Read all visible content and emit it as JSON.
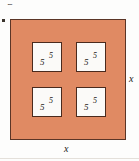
{
  "figure": {
    "clipped_caption": "igure.",
    "margin_bullet": "•",
    "outer_square": {
      "fill_color": "#e08a63",
      "border_color": "#5b3526",
      "width_label": "x",
      "height_label": "x"
    },
    "inner_squares": [
      {
        "position": "top-left",
        "base_label": "5",
        "side_label": "5",
        "fill_color": "#fbfaf8",
        "border_color": "#4a2a1d"
      },
      {
        "position": "top-right",
        "base_label": "5",
        "side_label": "5",
        "fill_color": "#fbfaf8",
        "border_color": "#4a2a1d"
      },
      {
        "position": "bottom-left",
        "base_label": "5",
        "side_label": "5",
        "fill_color": "#fbfaf8",
        "border_color": "#4a2a1d"
      },
      {
        "position": "bottom-right",
        "base_label": "5",
        "side_label": "5",
        "fill_color": "#fbfaf8",
        "border_color": "#4a2a1d"
      }
    ]
  }
}
